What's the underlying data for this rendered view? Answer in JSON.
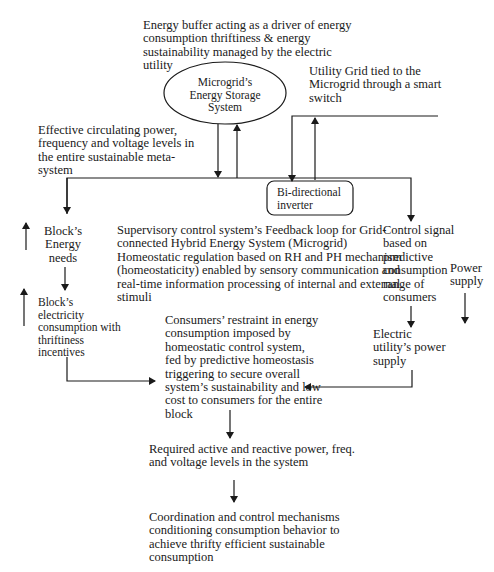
{
  "diagram": {
    "energy_buffer_note": "Energy buffer acting as a driver of energy\nconsumption thriftiness & energy\nsustainability managed by the electric\nutility",
    "storage_node": "Microgrid’s\nEnergy Storage\nSystem",
    "utility_grid_note": "Utility Grid tied to the\nMicrogrid through a smart\nswitch",
    "circulating_power_note": "Effective circulating power,\nfrequency and voltage levels in\nthe entire sustainable meta-\nsystem",
    "inverter_node": "Bi-directional\ninverter",
    "block_energy_needs": "Block’s\nEnergy\nneeds",
    "supervisory_note": "Supervisory control system’s Feedback loop for Grid-\nconnected Hybrid Energy System (Microgrid)\nHomeostatic regulation based on RH and PH mechanism\n(homeostaticity) enabled by sensory communication and\nreal-time information processing of internal and external\nstimuli",
    "control_signal_note": "Control signal\nbased on\npredictive\nconsumption\nrange of\nconsumers",
    "power_supply_note": "Power\nsupply",
    "block_consumption": "Block’s\nelectricity\nconsumption with\nthriftiness\nincentives",
    "consumers_restraint": "Consumers’ restraint in energy\nconsumption imposed by\nhomeostatic control system,\nfed by predictive homeostasis\ntriggering to secure overall\nsystem’s sustainability and low\ncost to consumers for the entire\nblock",
    "electric_utility_supply": "Electric\nutility’s power\nsupply",
    "required_levels": "Required active and reactive power, freq.\nand voltage levels in the system",
    "coordination": "Coordination and control mechanisms\nconditioning consumption behavior to\nachieve thrifty efficient sustainable\nconsumption"
  },
  "colors": {
    "line": "#1a1a1a",
    "background": "#ffffff"
  }
}
